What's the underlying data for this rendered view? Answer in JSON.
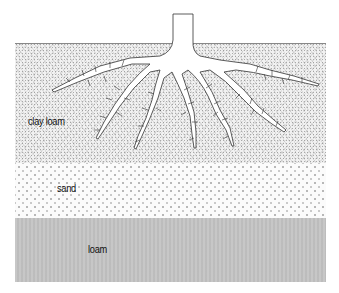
{
  "diagram": {
    "type": "soil profile with tree root system",
    "layers": [
      {
        "name": "clay loam",
        "label": "clay loam"
      },
      {
        "name": "sand",
        "label": "sand"
      },
      {
        "name": "loam",
        "label": "loam"
      }
    ],
    "colors": {
      "clay_loam": "#f1f1f1",
      "sand": "#fbfbfb",
      "loam": "#c4c4c4",
      "root_outline": "#333333"
    }
  }
}
